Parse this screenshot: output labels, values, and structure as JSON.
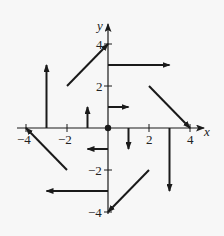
{
  "diagram": {
    "type": "vector-field",
    "axes": {
      "x_label": "x",
      "y_label": "y",
      "x_range": [
        -4,
        4
      ],
      "y_range": [
        -4,
        4
      ],
      "x_ticks": [
        {
          "value": -4,
          "label": "−4"
        },
        {
          "value": -2,
          "label": "−2"
        },
        {
          "value": 2,
          "label": "2"
        },
        {
          "value": 4,
          "label": "4"
        }
      ],
      "y_ticks": [
        {
          "value": 4,
          "label": "4"
        },
        {
          "value": 2,
          "label": "2"
        },
        {
          "value": -2,
          "label": "−2"
        },
        {
          "value": -4,
          "label": "−4"
        }
      ]
    },
    "origin_marker": {
      "x": 0,
      "y": 0
    },
    "vectors": [
      {
        "from": [
          0,
          1
        ],
        "to": [
          1,
          1
        ]
      },
      {
        "from": [
          0,
          3
        ],
        "to": [
          3,
          3
        ]
      },
      {
        "from": [
          -1,
          0
        ],
        "to": [
          -1,
          1
        ]
      },
      {
        "from": [
          -3,
          0
        ],
        "to": [
          -3,
          3
        ]
      },
      {
        "from": [
          0,
          -1
        ],
        "to": [
          -1,
          -1
        ]
      },
      {
        "from": [
          0,
          -3
        ],
        "to": [
          -3,
          -3
        ]
      },
      {
        "from": [
          1,
          0
        ],
        "to": [
          1,
          -1
        ]
      },
      {
        "from": [
          3,
          0
        ],
        "to": [
          3,
          -3
        ]
      },
      {
        "from": [
          -2,
          2
        ],
        "to": [
          0,
          4
        ]
      },
      {
        "from": [
          2,
          2
        ],
        "to": [
          4,
          0
        ]
      },
      {
        "from": [
          2,
          -2
        ],
        "to": [
          0,
          -4
        ]
      },
      {
        "from": [
          -2,
          -2
        ],
        "to": [
          -4,
          0
        ]
      }
    ],
    "colors": {
      "stroke": "#1a1a1a",
      "background": "#f7f7f7"
    }
  }
}
